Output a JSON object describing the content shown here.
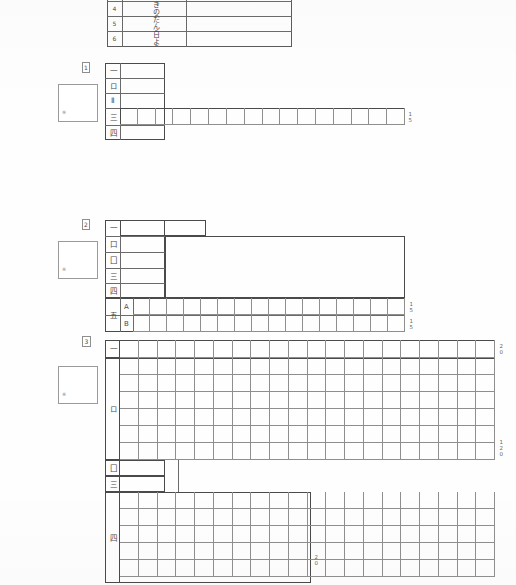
{
  "document": {
    "kind": "scanned-answer-sheet",
    "language": "ja"
  },
  "top_table": {
    "rows": [
      {
        "number": "4",
        "text": "きのうの"
      },
      {
        "number": "5",
        "text": "だんらく"
      },
      {
        "number": "6",
        "text": "日よう日"
      }
    ]
  },
  "block_one": {
    "marker": "1",
    "stamp_mark": "※",
    "rows": [
      {
        "label": "一",
        "type": "line"
      },
      {
        "label": "ロ",
        "type": "line"
      },
      {
        "label": "Ⅱ",
        "type": "line"
      },
      {
        "label": "三",
        "type": "grid",
        "cells": 16,
        "tick": "15"
      },
      {
        "label": "四",
        "type": "line"
      }
    ]
  },
  "block_two": {
    "marker": "2",
    "stamp_mark": "※",
    "rows": [
      {
        "label": "一",
        "type": "line"
      },
      {
        "label": "口",
        "type": "line"
      },
      {
        "label": "囗",
        "type": "line"
      },
      {
        "label": "三",
        "type": "line"
      },
      {
        "label": "四",
        "type": "line"
      }
    ],
    "ab_rows": [
      {
        "label": "A",
        "cells": 16,
        "tick": "15"
      },
      {
        "label": "B",
        "cells": 16,
        "tick": "15"
      }
    ],
    "ab_group_label": "五"
  },
  "block_three": {
    "marker": "3",
    "stamp_mark": "※",
    "rows": [
      {
        "label": "一",
        "type": "grid-row",
        "cells": 20,
        "tick": "20"
      },
      {
        "label": "ロ",
        "type": "grid-block",
        "cells": 20,
        "lines": 6,
        "tick": "120"
      },
      {
        "label": "囗",
        "type": "line"
      },
      {
        "label": "三",
        "type": "line"
      },
      {
        "label": "四",
        "type": "grid-block",
        "cells": 20,
        "lines": 5,
        "tick": "20"
      }
    ]
  },
  "colors": {
    "ink": "#4a4a4a",
    "rule": "#8e8e8e",
    "paper": "#fefefe"
  }
}
